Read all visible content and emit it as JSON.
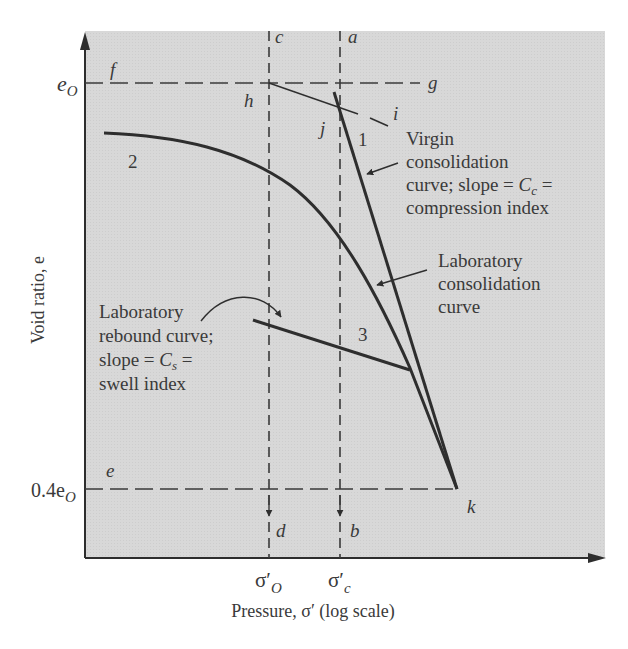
{
  "figure": {
    "type": "consolidation-curve-diagram",
    "y_axis_label": "Void ratio, e",
    "x_axis_label": "Pressure, σ′ (log scale)",
    "y_ticks": [
      {
        "label_main": "e",
        "label_sub": "O",
        "name": "initial-void-ratio"
      },
      {
        "label_main": "0.4e",
        "label_sub": "O",
        "name": "0.4-initial-void-ratio"
      }
    ],
    "x_ticks": [
      {
        "label_main": "σ′",
        "label_sub": "O",
        "name": "effective-overburden-pressure"
      },
      {
        "label_main": "σ′",
        "label_sub": "c",
        "name": "preconsolidation-pressure"
      }
    ],
    "point_labels": {
      "a": "a",
      "b": "b",
      "c": "c",
      "d": "d",
      "e": "e",
      "f": "f",
      "g": "g",
      "h": "h",
      "i": "i",
      "j": "j",
      "k": "k"
    },
    "curve_labels": {
      "one": "1",
      "two": "2",
      "three": "3"
    },
    "annotations": {
      "virgin": [
        "Virgin",
        "consolidation",
        "curve; slope = ",
        "C",
        "c",
        " =",
        "compression index"
      ],
      "laboratory_consolidation": [
        "Laboratory",
        "consolidation",
        "curve"
      ],
      "rebound": [
        "Laboratory",
        "rebound curve;",
        "slope = ",
        "C",
        "s",
        " =",
        "swell index"
      ]
    },
    "colors": {
      "plot_background": "#d6d6d6",
      "line": "#2e2e2e",
      "text": "#3a3a3a"
    }
  }
}
